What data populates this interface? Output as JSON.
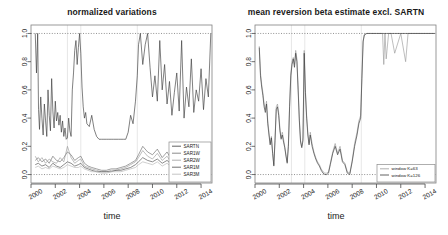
{
  "figure": {
    "xlabel": "time",
    "x_ticks": [
      "2000",
      "2002",
      "2004",
      "2006",
      "2008",
      "2010",
      "2012",
      "2014"
    ],
    "y_ticks": [
      "0.0",
      "0.2",
      "0.4",
      "0.6",
      "0.8",
      "1.0"
    ]
  },
  "chart_data": [
    {
      "type": "line",
      "title": "normalized variations",
      "xlabel": "time",
      "ylabel": "",
      "xlim": [
        2000.0,
        2014.9
      ],
      "ylim": [
        -0.06,
        1.06
      ],
      "grid": "horizontal dotted reference lines at 0.0 and 1.0; faint vertical lines at 2003.0, 2004.1, 2008.75",
      "legend_position": "bottom-right inside plot",
      "x_ticks": [
        2000,
        2002,
        2004,
        2006,
        2008,
        2010,
        2012,
        2014
      ],
      "y_ticks": [
        0.0,
        0.2,
        0.4,
        0.6,
        0.8,
        1.0
      ],
      "legend": [
        "SARTN",
        "SAR1W",
        "SAR2W",
        "SAR1M",
        "SAR3M"
      ],
      "series": [
        {
          "name": "SARTN",
          "color": "#3a3a3a",
          "x": [
            2000.35,
            2000.45,
            2000.55,
            2000.62,
            2000.7,
            2000.8,
            2000.9,
            2001.0,
            2001.1,
            2001.2,
            2001.3,
            2001.4,
            2001.5,
            2001.6,
            2001.7,
            2001.8,
            2001.9,
            2002.0,
            2002.1,
            2002.2,
            2002.3,
            2002.4,
            2002.5,
            2002.6,
            2002.7,
            2002.8,
            2002.9,
            2003.0,
            2003.1,
            2003.2,
            2003.3,
            2003.4,
            2003.5,
            2003.6,
            2003.7,
            2003.8,
            2003.9,
            2004.0,
            2004.1,
            2004.2,
            2004.3,
            2004.4,
            2004.5,
            2004.6,
            2004.8,
            2005.0,
            2005.2,
            2005.4,
            2005.6,
            2005.8,
            2006.0,
            2006.2,
            2006.4,
            2006.6,
            2006.8,
            2007.0,
            2007.2,
            2007.4,
            2007.6,
            2007.8,
            2008.0,
            2008.2,
            2008.4,
            2008.6,
            2008.75,
            2008.85,
            2009.0,
            2009.2,
            2009.4,
            2009.6,
            2009.8,
            2010.0,
            2010.2,
            2010.4,
            2010.6,
            2010.8,
            2011.0,
            2011.2,
            2011.4,
            2011.6,
            2011.8,
            2012.0,
            2012.2,
            2012.4,
            2012.6,
            2012.8,
            2013.0,
            2013.2,
            2013.4,
            2013.6,
            2013.8,
            2014.0,
            2014.2,
            2014.4,
            2014.6,
            2014.8
          ],
          "y": [
            1.0,
            0.72,
            1.0,
            0.46,
            0.32,
            0.55,
            0.4,
            0.28,
            0.5,
            0.38,
            0.27,
            0.6,
            0.42,
            0.31,
            0.68,
            0.45,
            0.33,
            0.52,
            0.38,
            0.44,
            0.35,
            0.42,
            0.3,
            0.38,
            0.27,
            0.33,
            0.25,
            0.26,
            0.4,
            0.31,
            0.27,
            0.6,
            0.72,
            0.88,
            0.95,
            0.78,
            0.9,
            1.0,
            0.86,
            0.62,
            0.48,
            0.4,
            0.44,
            0.36,
            0.34,
            0.42,
            0.32,
            0.27,
            0.25,
            0.25,
            0.25,
            0.25,
            0.25,
            0.25,
            0.25,
            0.25,
            0.25,
            0.25,
            0.25,
            0.25,
            0.3,
            0.42,
            0.36,
            0.52,
            0.7,
            0.92,
            1.0,
            0.78,
            0.92,
            1.0,
            0.76,
            0.55,
            0.7,
            0.52,
            0.95,
            0.6,
            0.78,
            0.5,
            0.66,
            0.42,
            0.58,
            0.72,
            0.45,
            0.95,
            0.4,
            0.62,
            0.48,
            0.82,
            0.44,
            0.6,
            0.52,
            0.75,
            0.46,
            0.68,
            0.55,
            1.0
          ]
        },
        {
          "name": "SAR1W",
          "color": "#6e6e6e",
          "x": [
            2000.35,
            2000.6,
            2000.9,
            2001.2,
            2001.5,
            2001.8,
            2002.1,
            2002.4,
            2002.7,
            2003.0,
            2003.3,
            2003.6,
            2003.9,
            2004.1,
            2004.4,
            2004.7,
            2005.0,
            2005.4,
            2005.8,
            2006.2,
            2006.6,
            2007.0,
            2007.4,
            2007.8,
            2008.2,
            2008.6,
            2008.85,
            2009.2,
            2009.6,
            2010.0,
            2010.4,
            2010.8,
            2011.2,
            2011.6,
            2012.0,
            2012.4,
            2012.8,
            2013.2,
            2013.6,
            2014.0,
            2014.4,
            2014.8
          ],
          "y": [
            0.1,
            0.12,
            0.09,
            0.11,
            0.08,
            0.13,
            0.1,
            0.09,
            0.12,
            0.16,
            0.14,
            0.1,
            0.12,
            0.13,
            0.08,
            0.06,
            0.05,
            0.04,
            0.03,
            0.03,
            0.04,
            0.04,
            0.05,
            0.06,
            0.08,
            0.1,
            0.14,
            0.2,
            0.16,
            0.14,
            0.18,
            0.12,
            0.16,
            0.1,
            0.14,
            0.09,
            0.12,
            0.08,
            0.11,
            0.07,
            0.1,
            0.08
          ]
        },
        {
          "name": "SAR2W",
          "color": "#9a9a9a",
          "x": [
            2000.35,
            2000.6,
            2000.9,
            2001.2,
            2001.5,
            2001.8,
            2002.1,
            2002.4,
            2002.7,
            2003.0,
            2003.3,
            2003.6,
            2003.9,
            2004.1,
            2004.4,
            2004.7,
            2005.0,
            2005.4,
            2005.8,
            2006.2,
            2006.6,
            2007.0,
            2007.4,
            2007.8,
            2008.2,
            2008.6,
            2008.85,
            2009.2,
            2009.6,
            2010.0,
            2010.4,
            2010.8,
            2011.2,
            2011.6,
            2012.0,
            2012.4,
            2012.8,
            2013.2,
            2013.6,
            2014.0,
            2014.4,
            2014.8
          ],
          "y": [
            0.13,
            0.09,
            0.12,
            0.08,
            0.11,
            0.09,
            0.08,
            0.12,
            0.09,
            0.2,
            0.12,
            0.08,
            0.1,
            0.11,
            0.06,
            0.05,
            0.04,
            0.03,
            0.02,
            0.02,
            0.03,
            0.03,
            0.04,
            0.05,
            0.07,
            0.09,
            0.12,
            0.17,
            0.13,
            0.11,
            0.15,
            0.1,
            0.13,
            0.08,
            0.11,
            0.07,
            0.1,
            0.06,
            0.09,
            0.06,
            0.08,
            0.06
          ]
        },
        {
          "name": "SAR1M",
          "color": "#4d4d4d",
          "x": [
            2000.35,
            2000.6,
            2000.9,
            2001.2,
            2001.5,
            2001.8,
            2002.1,
            2002.4,
            2002.7,
            2003.0,
            2003.3,
            2003.6,
            2003.9,
            2004.1,
            2004.4,
            2004.7,
            2005.0,
            2005.4,
            2005.8,
            2006.2,
            2006.6,
            2007.0,
            2007.4,
            2007.8,
            2008.2,
            2008.6,
            2008.85,
            2009.2,
            2009.6,
            2010.0,
            2010.4,
            2010.8,
            2011.2,
            2011.6,
            2012.0,
            2012.4,
            2012.8,
            2013.2,
            2013.6,
            2014.0,
            2014.4,
            2014.8
          ],
          "y": [
            0.07,
            0.08,
            0.06,
            0.07,
            0.05,
            0.08,
            0.06,
            0.05,
            0.07,
            0.09,
            0.08,
            0.06,
            0.07,
            0.08,
            0.05,
            0.04,
            0.03,
            0.02,
            0.02,
            0.02,
            0.02,
            0.03,
            0.03,
            0.04,
            0.05,
            0.07,
            0.09,
            0.12,
            0.1,
            0.09,
            0.11,
            0.08,
            0.1,
            0.07,
            0.09,
            0.06,
            0.08,
            0.05,
            0.07,
            0.05,
            0.07,
            0.05
          ]
        },
        {
          "name": "SAR3M",
          "color": "#b5b5b5",
          "x": [
            2000.35,
            2000.6,
            2000.9,
            2001.2,
            2001.5,
            2001.8,
            2002.1,
            2002.4,
            2002.7,
            2003.0,
            2003.3,
            2003.6,
            2003.9,
            2004.1,
            2004.4,
            2004.7,
            2005.0,
            2005.4,
            2005.8,
            2006.2,
            2006.6,
            2007.0,
            2007.4,
            2007.8,
            2008.2,
            2008.6,
            2008.85,
            2009.2,
            2009.6,
            2010.0,
            2010.4,
            2010.8,
            2011.2,
            2011.6,
            2012.0,
            2012.4,
            2012.8,
            2013.2,
            2013.6,
            2014.0,
            2014.4,
            2014.8
          ],
          "y": [
            0.05,
            0.06,
            0.04,
            0.05,
            0.04,
            0.06,
            0.05,
            0.04,
            0.05,
            0.07,
            0.06,
            0.05,
            0.05,
            0.06,
            0.04,
            0.03,
            0.02,
            0.02,
            0.01,
            0.01,
            0.02,
            0.02,
            0.02,
            0.03,
            0.04,
            0.05,
            0.07,
            0.09,
            0.08,
            0.07,
            0.09,
            0.06,
            0.08,
            0.05,
            0.07,
            0.05,
            0.06,
            0.04,
            0.06,
            0.04,
            0.05,
            0.04
          ]
        }
      ]
    },
    {
      "type": "line",
      "title": "mean reversion beta estimate excl. SARTN",
      "xlabel": "time",
      "ylabel": "",
      "xlim": [
        2000.0,
        2014.9
      ],
      "ylim": [
        -0.06,
        1.06
      ],
      "grid": "horizontal dotted reference lines at 0.0 and 1.0; faint vertical lines at 2003.0, 2004.1, 2008.75",
      "legend_position": "bottom-right inside plot",
      "x_ticks": [
        2000,
        2002,
        2004,
        2006,
        2008,
        2010,
        2012,
        2014
      ],
      "y_ticks": [
        0.0,
        0.2,
        0.4,
        0.6,
        0.8,
        1.0
      ],
      "legend": [
        "window K=63",
        "window K=126"
      ],
      "series": [
        {
          "name": "window K=63",
          "color": "#9a9a9a",
          "x": [
            2000.35,
            2000.45,
            2000.55,
            2000.65,
            2000.75,
            2000.85,
            2000.95,
            2001.05,
            2001.15,
            2001.25,
            2001.35,
            2001.45,
            2001.55,
            2001.65,
            2001.75,
            2001.85,
            2001.95,
            2002.05,
            2002.15,
            2002.25,
            2002.35,
            2002.45,
            2002.55,
            2002.65,
            2002.75,
            2002.85,
            2002.95,
            2003.05,
            2003.15,
            2003.25,
            2003.35,
            2003.45,
            2003.55,
            2003.65,
            2003.75,
            2003.85,
            2003.95,
            2004.05,
            2004.15,
            2004.25,
            2004.35,
            2004.45,
            2004.55,
            2004.7,
            2004.85,
            2005.0,
            2005.15,
            2005.3,
            2005.45,
            2005.6,
            2005.75,
            2005.9,
            2006.05,
            2006.2,
            2006.4,
            2006.6,
            2006.8,
            2007.0,
            2007.2,
            2007.4,
            2007.6,
            2007.8,
            2008.0,
            2008.2,
            2008.4,
            2008.55,
            2008.7,
            2008.8,
            2008.9,
            2009.0,
            2009.2,
            2009.5,
            2010.0,
            2010.5,
            2010.6,
            2010.7,
            2010.8,
            2011.0,
            2011.2,
            2011.5,
            2012.0,
            2012.4,
            2012.6,
            2013.0,
            2013.5,
            2014.0,
            2014.5,
            2014.8
          ],
          "y": [
            0.91,
            0.72,
            0.64,
            0.58,
            0.5,
            0.46,
            0.52,
            0.38,
            0.3,
            0.22,
            0.27,
            0.16,
            0.07,
            0.26,
            0.48,
            0.5,
            0.44,
            0.33,
            0.26,
            0.3,
            0.25,
            0.2,
            0.14,
            0.09,
            0.22,
            0.5,
            0.72,
            0.8,
            0.83,
            0.78,
            0.88,
            0.82,
            0.62,
            0.4,
            0.24,
            0.2,
            0.26,
            0.88,
            0.6,
            0.42,
            0.3,
            0.22,
            0.3,
            0.22,
            0.16,
            0.12,
            0.09,
            0.07,
            0.04,
            0.02,
            0.01,
            0.01,
            0.02,
            0.08,
            0.16,
            0.22,
            0.15,
            0.2,
            0.1,
            0.08,
            0.02,
            0.01,
            0.1,
            0.22,
            0.3,
            0.38,
            0.42,
            0.7,
            0.95,
            0.99,
            1.0,
            1.0,
            1.0,
            1.0,
            0.78,
            1.0,
            0.82,
            1.0,
            1.0,
            0.86,
            1.0,
            0.8,
            1.0,
            1.0,
            1.0,
            1.0,
            1.0,
            1.0
          ]
        },
        {
          "name": "window K=126",
          "color": "#3a3a3a",
          "x": [
            2000.35,
            2000.45,
            2000.55,
            2000.65,
            2000.75,
            2000.85,
            2000.95,
            2001.05,
            2001.15,
            2001.25,
            2001.35,
            2001.45,
            2001.55,
            2001.65,
            2001.75,
            2001.85,
            2001.95,
            2002.05,
            2002.15,
            2002.25,
            2002.35,
            2002.45,
            2002.55,
            2002.65,
            2002.75,
            2002.85,
            2002.95,
            2003.05,
            2003.15,
            2003.25,
            2003.35,
            2003.45,
            2003.55,
            2003.65,
            2003.75,
            2003.85,
            2003.95,
            2004.05,
            2004.15,
            2004.25,
            2004.35,
            2004.45,
            2004.55,
            2004.7,
            2004.85,
            2005.0,
            2005.15,
            2005.3,
            2005.45,
            2005.6,
            2005.75,
            2005.9,
            2006.05,
            2006.2,
            2006.4,
            2006.6,
            2006.8,
            2007.0,
            2007.2,
            2007.4,
            2007.6,
            2007.8,
            2008.0,
            2008.2,
            2008.4,
            2008.55,
            2008.7,
            2008.8,
            2008.9,
            2009.0,
            2009.2,
            2009.5,
            2010.0,
            2010.5,
            2010.6,
            2010.7,
            2010.8,
            2011.0,
            2011.2,
            2011.5,
            2012.0,
            2012.4,
            2012.6,
            2013.0,
            2013.5,
            2014.0,
            2014.5,
            2014.8
          ],
          "y": [
            0.9,
            0.7,
            0.62,
            0.56,
            0.48,
            0.44,
            0.5,
            0.36,
            0.28,
            0.21,
            0.26,
            0.15,
            0.06,
            0.24,
            0.46,
            0.48,
            0.42,
            0.31,
            0.25,
            0.28,
            0.23,
            0.19,
            0.13,
            0.08,
            0.2,
            0.48,
            0.7,
            0.78,
            0.82,
            0.76,
            0.86,
            0.8,
            0.6,
            0.38,
            0.23,
            0.19,
            0.24,
            0.86,
            0.58,
            0.4,
            0.28,
            0.21,
            0.28,
            0.2,
            0.15,
            0.11,
            0.08,
            0.06,
            0.03,
            0.01,
            0.0,
            0.0,
            0.01,
            0.07,
            0.15,
            0.2,
            0.14,
            0.18,
            0.09,
            0.07,
            0.01,
            0.0,
            0.09,
            0.2,
            0.28,
            0.36,
            0.4,
            0.68,
            0.94,
            0.99,
            1.0,
            1.0,
            1.0,
            1.0,
            1.0,
            1.0,
            1.0,
            1.0,
            1.0,
            1.0,
            1.0,
            1.0,
            1.0,
            1.0,
            1.0,
            1.0,
            1.0,
            1.0
          ]
        }
      ]
    }
  ]
}
